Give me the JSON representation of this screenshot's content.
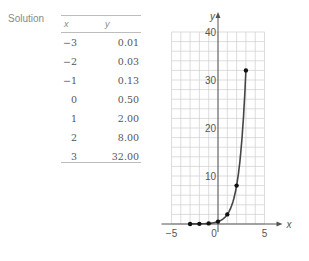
{
  "label": "Solution",
  "table": {
    "headers": [
      "x",
      "y"
    ],
    "rows": [
      {
        "x": "−3",
        "y": "0.01"
      },
      {
        "x": "−2",
        "y": "0.03"
      },
      {
        "x": "−1",
        "y": "0.13"
      },
      {
        "x": "0",
        "y": "0.50"
      },
      {
        "x": "1",
        "y": "2.00"
      },
      {
        "x": "2",
        "y": "8.00"
      },
      {
        "x": "3",
        "y": "32.00"
      }
    ]
  },
  "chart_data": {
    "type": "line",
    "title": "",
    "xlabel": "x",
    "ylabel": "y",
    "x": [
      -3,
      -2,
      -1,
      0,
      1,
      2,
      3
    ],
    "series": [
      {
        "name": "y = 0.5 * 4^x",
        "values": [
          0.01,
          0.03,
          0.13,
          0.5,
          2,
          8,
          32
        ]
      }
    ],
    "xlim": [
      -5,
      5
    ],
    "ylim": [
      0,
      40
    ],
    "x_ticks": [
      "-5",
      "0",
      "5"
    ],
    "y_ticks": [
      "10",
      "20",
      "30",
      "40"
    ],
    "grid": true,
    "markers": true,
    "colors": {
      "curve": "#444444",
      "grid": "#cfcfcf",
      "axis": "#555555"
    }
  }
}
